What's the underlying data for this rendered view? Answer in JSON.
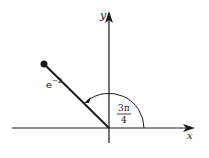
{
  "diagram": {
    "type": "polar-complex-plane",
    "x_axis_label": "x",
    "y_axis_label": "y",
    "modulus_label_base": "e",
    "modulus_label_exp": "−2",
    "angle_label_num": "3π",
    "angle_label_den": "4",
    "colors": {
      "ink": "#1a1a1a",
      "background": "#ffffff"
    }
  }
}
